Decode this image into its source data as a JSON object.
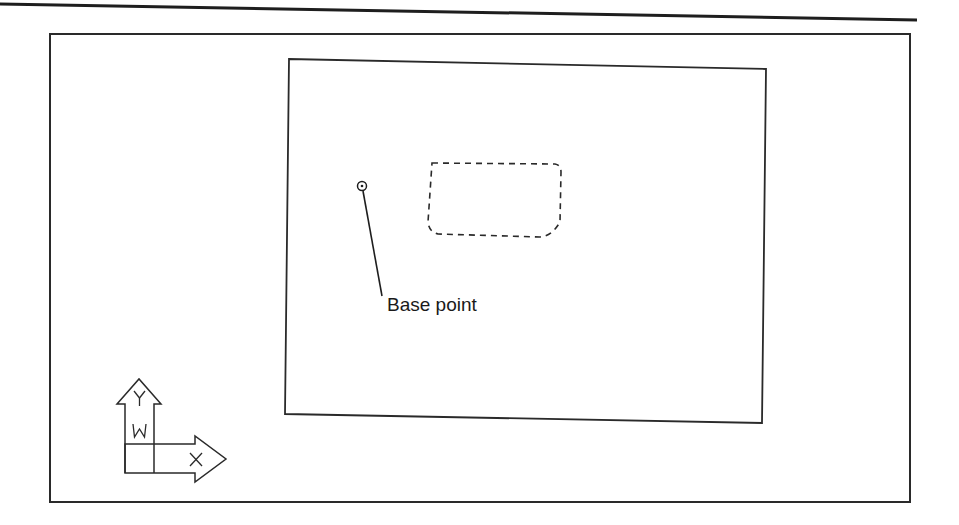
{
  "drawing": {
    "top_rule": {
      "x1": 0,
      "y1": 4,
      "x2": 917,
      "y2": 20,
      "stroke_width": 3
    },
    "outer_frame": {
      "x": 50,
      "y": 34,
      "width": 860,
      "height": 468,
      "stroke_width": 2
    },
    "viewport_rect": {
      "points": "289,59 766,69 762,423 285,414",
      "stroke_width": 1.8
    },
    "selection_object": {
      "style": "dashed",
      "path": "M 432 163 L 555 164 Q 561 165 561 172 L 560 222 Q 552 236 540 237 L 438 234 Q 429 232 428 222 Z",
      "dash": "6,5"
    },
    "base_point": {
      "marker": {
        "cx": 362,
        "cy": 186,
        "r_outer": 4.5,
        "r_inner": 1.3
      },
      "leader": {
        "x1": 363,
        "y1": 191,
        "x2": 382,
        "y2": 296
      },
      "label": "Base point",
      "label_x": 387,
      "label_y": 311
    },
    "ucs_icon": {
      "y_label": "Y",
      "w_label": "W",
      "x_label": "X",
      "y_arrow_path": "M 125 473 L 125 404 L 117 404 L 139 379 L 161 404 L 154 404 L 154 444",
      "x_arrow_path": "M 125 444 L 195 444 L 195 436 L 226 459 L 195 482 L 195 473 L 125 473 Z",
      "divider_path": "M 154 444 L 154 473"
    },
    "colors": {
      "ink": "#2a2a2a",
      "heavy_ink": "#1e1e1e",
      "background": "#ffffff"
    }
  }
}
